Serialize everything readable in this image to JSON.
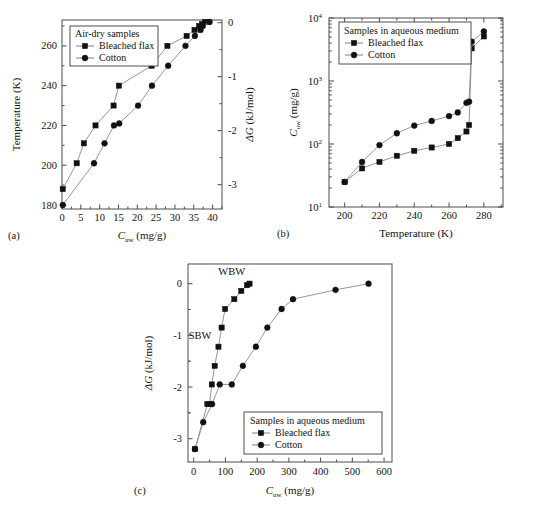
{
  "figure": {
    "background": "#ffffff",
    "marker_color": "#111111",
    "line_color": "#8a8a8a",
    "axis_color": "#4c4c4c"
  },
  "panels": {
    "a": {
      "label": "(a)",
      "legend_title": "Air-dry samples",
      "legend_items": [
        "Bleached flax",
        "Cotton"
      ],
      "ylabel": "Temperature (K)",
      "ylabel_right": "ΔG (kJ/mol)",
      "xlabel": "C",
      "xlabel_sub": "uw",
      "xlabel_unit": " (mg/g)",
      "xticks": [
        "0",
        "5",
        "10",
        "15",
        "20",
        "25",
        "30",
        "35",
        "40"
      ],
      "yticks": [
        "180",
        "200",
        "220",
        "240",
        "260"
      ],
      "yticks_right": [
        "0",
        "-1",
        "-2",
        "-3"
      ]
    },
    "b": {
      "label": "(b)",
      "legend_title": "Samples in aqueous medium",
      "legend_items": [
        "Bleached flax",
        "Cotton"
      ],
      "ylabel": "C",
      "ylabel_sub": "uw",
      "ylabel_unit": " (mg/g)",
      "xlabel": "Temperature (K)",
      "xticks": [
        "200",
        "220",
        "240",
        "260",
        "280"
      ],
      "yticks": [
        "10",
        "10",
        "10",
        "10"
      ],
      "yticks_exp": [
        "1",
        "2",
        "3",
        "4"
      ]
    },
    "c": {
      "label": "(c)",
      "legend_title": "Samples in aqueous medium",
      "legend_items": [
        "Bleached flax",
        "Cotton"
      ],
      "ylabel": "ΔG (kJ/mol)",
      "xlabel": "C",
      "xlabel_sub": "uw",
      "xlabel_unit": " (mg/g)",
      "xticks": [
        "0",
        "100",
        "200",
        "300",
        "400",
        "500",
        "600"
      ],
      "yticks": [
        "0",
        "-1",
        "-2",
        "-3"
      ],
      "annotations": [
        "WBW",
        "SBW"
      ]
    }
  },
  "chart_data": [
    {
      "type": "scatter",
      "panel": "(a)",
      "title": "Air-dry samples",
      "xlabel": "C_uw (mg/g)",
      "ylabel": "Temperature (K)",
      "ylabel_right": "ΔG (kJ/mol)",
      "xlim": [
        0,
        42.5
      ],
      "ylim": [
        178,
        273
      ],
      "ylim_right": [
        -3.45,
        0.05
      ],
      "grid": false,
      "legend_position": "top-left",
      "series": [
        {
          "name": "Bleached flax",
          "marker": "square",
          "x": [
            0.2,
            3.9,
            5.8,
            8.9,
            13.7,
            15.1,
            23.8,
            28.0,
            33.1,
            35.2,
            36.4,
            37.2,
            38.0
          ],
          "y": [
            188,
            201,
            211,
            220,
            230,
            240,
            250,
            260,
            265,
            268,
            270,
            271,
            272
          ]
        },
        {
          "name": "Cotton",
          "marker": "circle",
          "x": [
            0.2,
            8.5,
            11.3,
            13.8,
            15.2,
            20.2,
            23.9,
            28.2,
            32.8,
            35.3,
            36.8,
            37.4,
            39.2
          ],
          "y": [
            180,
            201,
            211,
            220,
            221,
            230,
            240,
            250,
            260,
            265,
            268,
            270,
            272
          ]
        }
      ]
    },
    {
      "type": "line",
      "panel": "(b)",
      "title": "Samples in aqueous medium",
      "xlabel": "Temperature (K)",
      "ylabel": "C_uw (mg/g)",
      "xlim": [
        191,
        291
      ],
      "ylim": [
        10,
        10000
      ],
      "yscale": "log",
      "grid": false,
      "legend_position": "top-left",
      "series": [
        {
          "name": "Bleached flax",
          "marker": "square",
          "x": [
            200,
            210,
            220,
            230,
            240,
            250,
            260,
            265,
            270,
            271.5,
            273,
            280
          ],
          "y": [
            25,
            41,
            52,
            65,
            78,
            88,
            100,
            124,
            158,
            200,
            3300,
            5100
          ]
        },
        {
          "name": "Cotton",
          "marker": "circle",
          "x": [
            200,
            210,
            220,
            230,
            240,
            250,
            260,
            265,
            270,
            271.5,
            273,
            280
          ],
          "y": [
            25,
            52,
            96,
            148,
            196,
            232,
            277,
            317,
            450,
            470,
            4200,
            6100
          ]
        }
      ]
    },
    {
      "type": "line",
      "panel": "(c)",
      "title": "Samples in aqueous medium",
      "xlabel": "C_uw (mg/g)",
      "ylabel": "ΔG (kJ/mol)",
      "xlim": [
        -18,
        625
      ],
      "ylim": [
        -3.45,
        0.38
      ],
      "grid": false,
      "legend_position": "bottom-right",
      "annotations": [
        {
          "text": "WBW",
          "x": 120,
          "y": 0.17
        },
        {
          "text": "SBW",
          "x": 20,
          "y": -1.07
        }
      ],
      "series": [
        {
          "name": "Bleached flax",
          "marker": "square",
          "x": [
            4,
            43,
            50,
            57,
            66,
            78,
            88,
            99,
            128,
            150,
            168,
            176
          ],
          "y": [
            -3.2,
            -2.33,
            -2.33,
            -1.95,
            -1.59,
            -1.22,
            -0.85,
            -0.49,
            -0.3,
            -0.14,
            -0.03,
            0.0
          ]
        },
        {
          "name": "Cotton",
          "marker": "circle",
          "x": [
            4,
            30,
            58,
            82,
            120,
            155,
            196,
            232,
            277,
            313,
            447,
            551
          ],
          "y": [
            -3.2,
            -2.68,
            -2.33,
            -1.95,
            -1.95,
            -1.59,
            -1.22,
            -0.85,
            -0.49,
            -0.3,
            -0.12,
            0.0
          ]
        }
      ]
    }
  ]
}
